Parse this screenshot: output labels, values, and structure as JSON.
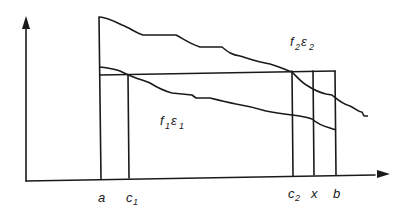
{
  "diagram": {
    "type": "function-comparison-diagram",
    "axes": {
      "x_axis": "horizontal",
      "y_axis": "vertical",
      "arrows": true
    },
    "x_labels": [
      {
        "id": "a",
        "base": "a",
        "sub": ""
      },
      {
        "id": "c1",
        "base": "c",
        "sub": "1"
      },
      {
        "id": "c2",
        "base": "c",
        "sub": "2"
      },
      {
        "id": "x",
        "base": "x",
        "sub": ""
      },
      {
        "id": "b",
        "base": "b",
        "sub": ""
      }
    ],
    "curves": [
      {
        "id": "f2",
        "label_f": "f",
        "label_f_sub": "2",
        "label_e": "ε",
        "label_e_sub": "2",
        "description": "upper decreasing step-like curve starting at a"
      },
      {
        "id": "f1",
        "label_f": "f",
        "label_f_sub": "1",
        "label_e": "ε",
        "label_e_sub": "1",
        "description": "lower decreasing step-like curve starting at a, ending at b"
      }
    ],
    "horizontal_level": {
      "description": "horizontal line from a to b at height where f1 meets at c1 and f2 meets at c2"
    },
    "vertical_lines": [
      "a",
      "c1",
      "c2",
      "x",
      "b"
    ]
  }
}
